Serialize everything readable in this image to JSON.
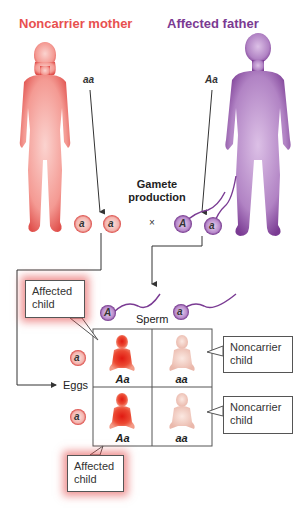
{
  "parents": {
    "mother": {
      "title": "Noncarrier mother",
      "genotype": "aa",
      "color": "#e8504f"
    },
    "father": {
      "title": "Affected father",
      "genotype": "Aa",
      "color": "#7b3a92"
    }
  },
  "gamete_production": {
    "line1": "Gamete",
    "line2": "production"
  },
  "gametes": {
    "eggs": [
      "a",
      "a"
    ],
    "cross_symbol": "×",
    "sperm": [
      "A",
      "a"
    ]
  },
  "punnett": {
    "sperm_label": "Sperm",
    "eggs_label": "Eggs",
    "sperm_alleles": [
      "A",
      "a"
    ],
    "egg_alleles": [
      "a",
      "a"
    ],
    "cells": [
      {
        "genotype": "Aa",
        "status": "affected"
      },
      {
        "genotype": "aa",
        "status": "noncarrier"
      },
      {
        "genotype": "Aa",
        "status": "affected"
      },
      {
        "genotype": "aa",
        "status": "noncarrier"
      }
    ]
  },
  "callouts": {
    "affected_top": {
      "line1": "Affected",
      "line2": "child"
    },
    "affected_bottom": {
      "line1": "Affected",
      "line2": "child"
    },
    "noncarrier_top": {
      "line1": "Noncarrier",
      "line2": "child"
    },
    "noncarrier_bottom": {
      "line1": "Noncarrier",
      "line2": "child"
    }
  },
  "colors": {
    "egg_fill": "#f6c7c4",
    "egg_ring": "#d9413d",
    "sperm_fill": "#b88acb",
    "sperm_ring": "#6e2f87",
    "affected_child": "#e5362b",
    "noncarrier_child": "#f2cfc5"
  }
}
